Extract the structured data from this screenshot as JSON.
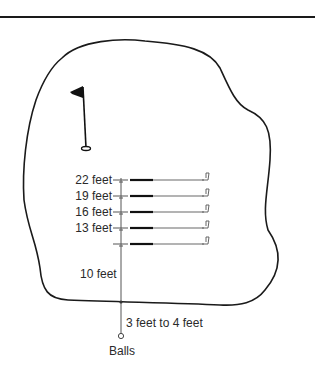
{
  "diagram": {
    "distance_labels": [
      {
        "label": "22 feet",
        "y": 180
      },
      {
        "label": "19 feet",
        "y": 196
      },
      {
        "label": "16 feet",
        "y": 212
      },
      {
        "label": "13 feet",
        "y": 228
      },
      {
        "label": "",
        "y": 244
      }
    ],
    "gap_label": "10 feet",
    "offgreen_label": "3 feet to 4 feet",
    "balls_label": "Balls",
    "elements": {
      "green": "putting-green-outline",
      "flag": "flagstick-with-hole",
      "clubs": 5,
      "ball_marker": "balls-position"
    },
    "colors": {
      "line": "#1a1a1a",
      "shaft": "#9a9a9a",
      "grip": "#111111",
      "measure": "#555555"
    }
  }
}
